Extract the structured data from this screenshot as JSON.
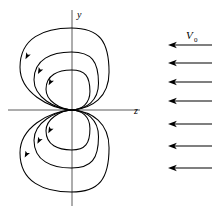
{
  "figure": {
    "background_color": "#ffffff",
    "stroke_color": "#000000",
    "axis_color": "#555555"
  },
  "axes": {
    "vertical": {
      "label": "y",
      "x": 72,
      "y_top": 10,
      "y_bottom": 206
    },
    "horizontal": {
      "label": "z",
      "y": 110,
      "x_left": 8,
      "x_right": 140
    },
    "origin": {
      "x": 72,
      "y": 110
    }
  },
  "streamlines": {
    "description": "Three nested closed loops above and three below the z-axis, all meeting at a cusp at the origin",
    "upper_count": 3,
    "lower_count": 3,
    "arrow_direction": "down-left",
    "loops_upper": [
      {
        "name": "upper-loop-outer",
        "half_width": 39,
        "height": 82,
        "left_bias": 13
      },
      {
        "name": "upper-loop-middle",
        "half_width": 28,
        "height": 58,
        "left_bias": 10
      },
      {
        "name": "upper-loop-inner",
        "half_width": 19,
        "height": 40,
        "left_bias": 7
      }
    ],
    "loops_lower": [
      {
        "name": "lower-loop-outer",
        "half_width": 39,
        "height": 82,
        "left_bias": 13
      },
      {
        "name": "lower-loop-middle",
        "half_width": 28,
        "height": 58,
        "left_bias": 10
      },
      {
        "name": "lower-loop-inner",
        "half_width": 19,
        "height": 40,
        "left_bias": 7
      }
    ]
  },
  "uniform_flow": {
    "label": "V",
    "label_subscript": "0",
    "label_x": 190,
    "label_y": 38,
    "direction": "left",
    "arrow_count": 7,
    "arrows": [
      {
        "name": "flow-arrow-1",
        "y": 45,
        "x_start": 212,
        "x_end": 168
      },
      {
        "name": "flow-arrow-2",
        "y": 63,
        "x_start": 212,
        "x_end": 168
      },
      {
        "name": "flow-arrow-3",
        "y": 82,
        "x_start": 212,
        "x_end": 168
      },
      {
        "name": "flow-arrow-4",
        "y": 101,
        "x_start": 212,
        "x_end": 168
      },
      {
        "name": "flow-arrow-5",
        "y": 124,
        "x_start": 212,
        "x_end": 168
      },
      {
        "name": "flow-arrow-6",
        "y": 146,
        "x_start": 212,
        "x_end": 168
      },
      {
        "name": "flow-arrow-7",
        "y": 168,
        "x_start": 212,
        "x_end": 168
      }
    ]
  },
  "chart_data": {
    "type": "line",
    "xlabel": "z",
    "ylabel": "y",
    "grid": false,
    "legend": null,
    "annotations": [
      {
        "text": "V0",
        "x": 190,
        "y": 38
      },
      {
        "text": "y",
        "x": 77,
        "y": 17
      },
      {
        "text": "z",
        "x": 136,
        "y": 113
      }
    ],
    "series": [
      {
        "name": "upper-loop-outer",
        "closed": true,
        "half_width": 39,
        "height": 82
      },
      {
        "name": "upper-loop-middle",
        "closed": true,
        "half_width": 28,
        "height": 58
      },
      {
        "name": "upper-loop-inner",
        "closed": true,
        "half_width": 19,
        "height": 40
      },
      {
        "name": "lower-loop-outer",
        "closed": true,
        "half_width": 39,
        "height": 82
      },
      {
        "name": "lower-loop-middle",
        "closed": true,
        "half_width": 28,
        "height": 58
      },
      {
        "name": "lower-loop-inner",
        "closed": true,
        "half_width": 19,
        "height": 40
      },
      {
        "name": "uniform-flow-arrows",
        "closed": false,
        "count": 7,
        "direction": "left"
      }
    ]
  }
}
